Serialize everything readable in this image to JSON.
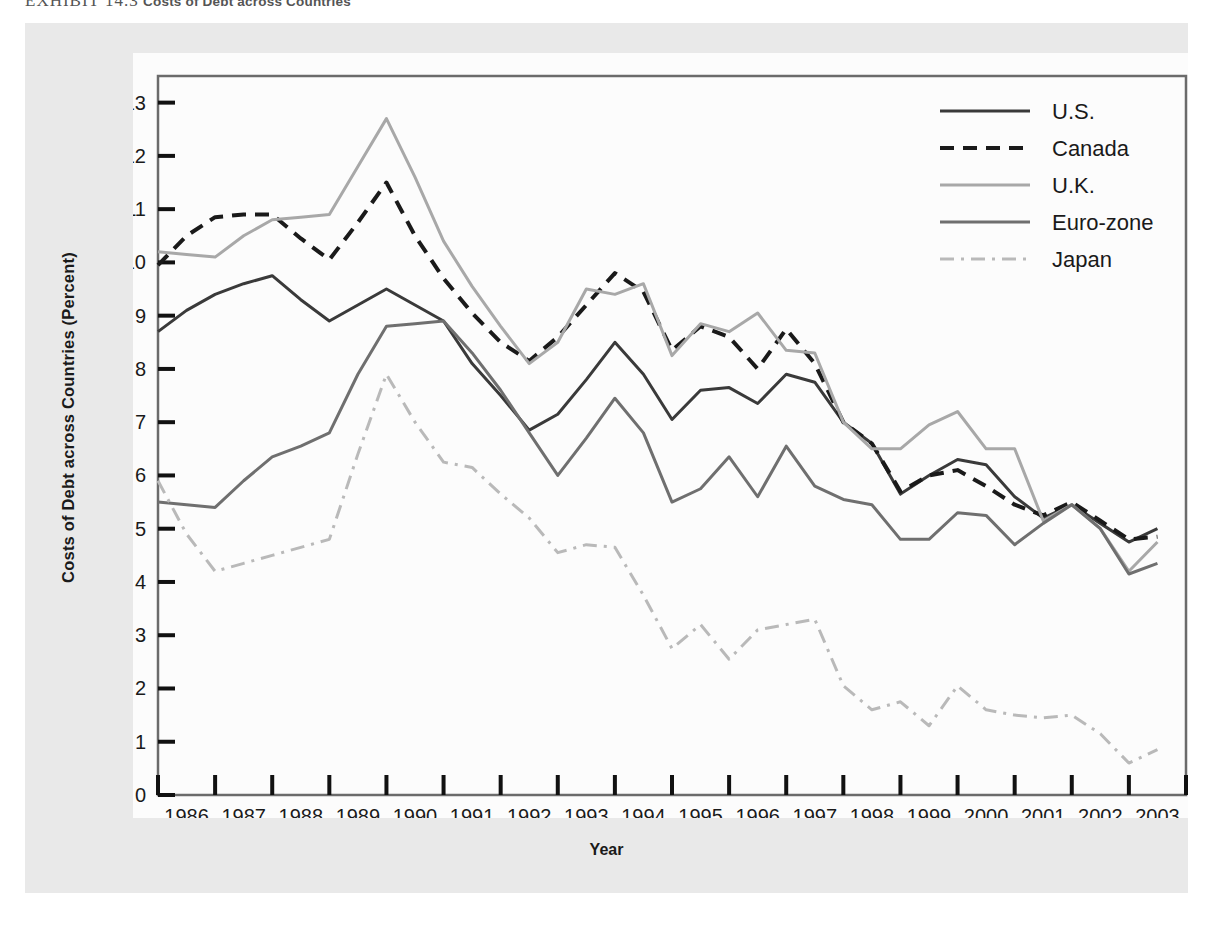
{
  "exhibit": {
    "number": "EXHIBIT 14.3",
    "caption": "Costs of Debt across Countries"
  },
  "axis_titles": {
    "x": "Year",
    "y": "Costs of Debt across Countries (Percent)"
  },
  "colors": {
    "us": "#3a3a3a",
    "canada": "#1a1a1a",
    "uk": "#a8a8a8",
    "eurozone": "#6f6f6f",
    "japan": "#b9b9b9",
    "panel": "#e9e9e9",
    "canvas": "#fcfcfc",
    "axis": "#6b6b6b",
    "text": "#1a1a1a"
  },
  "chart_data": {
    "type": "line",
    "title": "Costs of Debt across Countries",
    "xlabel": "Year",
    "ylabel": "Costs of Debt across Countries (Percent)",
    "xlim": [
      1986,
      2004
    ],
    "ylim": [
      0,
      13.5
    ],
    "ytick_values": [
      0,
      1,
      2,
      3,
      4,
      5,
      6,
      7,
      8,
      9,
      10,
      11,
      12,
      13
    ],
    "ytick_labels": [
      "0",
      "1",
      "2",
      "3",
      "4",
      "5",
      "6",
      "7",
      "8",
      "9",
      "10",
      "11",
      "12",
      "13"
    ],
    "xtick_values": [
      1986,
      1987,
      1988,
      1989,
      1990,
      1991,
      1992,
      1993,
      1994,
      1995,
      1996,
      1997,
      1998,
      1999,
      2000,
      2001,
      2002,
      2003,
      2004
    ],
    "xtick_labels": [
      "1986",
      "1987",
      "1988",
      "1989",
      "1990",
      "1991",
      "1992",
      "1993",
      "1994",
      "1995",
      "1996",
      "1997",
      "1998",
      "1999",
      "2000",
      "2001",
      "2002",
      "2003"
    ],
    "grid": false,
    "legend_position": "top-right",
    "x": [
      1986.0,
      1986.5,
      1987.0,
      1987.5,
      1988.0,
      1988.5,
      1989.0,
      1989.5,
      1990.0,
      1990.5,
      1991.0,
      1991.5,
      1992.0,
      1992.5,
      1993.0,
      1993.5,
      1994.0,
      1994.5,
      1995.0,
      1995.5,
      1996.0,
      1996.5,
      1997.0,
      1997.5,
      1998.0,
      1998.5,
      1999.0,
      1999.5,
      2000.0,
      2000.5,
      2001.0,
      2001.5,
      2002.0,
      2002.5,
      2003.0,
      2003.5
    ],
    "series": [
      {
        "name": "U.S.",
        "style": "solid",
        "color": "#3a3a3a",
        "values": [
          8.7,
          9.1,
          9.4,
          9.6,
          9.75,
          9.3,
          8.9,
          9.2,
          9.5,
          9.2,
          8.9,
          8.1,
          7.5,
          6.85,
          7.15,
          7.8,
          8.5,
          7.9,
          7.05,
          7.6,
          7.65,
          7.35,
          7.9,
          7.75,
          7.0,
          6.6,
          5.65,
          6.0,
          6.3,
          6.2,
          5.6,
          5.2,
          5.45,
          5.1,
          4.75,
          5.0
        ]
      },
      {
        "name": "Canada",
        "style": "dashed",
        "color": "#1a1a1a",
        "values": [
          9.95,
          10.5,
          10.85,
          10.9,
          10.9,
          10.45,
          10.05,
          10.75,
          11.5,
          10.5,
          9.7,
          9.05,
          8.5,
          8.15,
          8.6,
          9.2,
          9.8,
          9.45,
          8.35,
          8.8,
          8.6,
          8.0,
          8.75,
          8.1,
          7.0,
          6.6,
          5.7,
          6.0,
          6.1,
          5.8,
          5.45,
          5.25,
          5.5,
          5.15,
          4.8,
          4.85
        ]
      },
      {
        "name": "U.K.",
        "style": "solid",
        "color": "#a8a8a8",
        "values": [
          10.2,
          10.15,
          10.1,
          10.5,
          10.8,
          10.85,
          10.9,
          11.8,
          12.7,
          11.6,
          10.4,
          9.55,
          8.8,
          8.1,
          8.5,
          9.5,
          9.4,
          9.6,
          8.25,
          8.85,
          8.7,
          9.05,
          8.35,
          8.3,
          7.0,
          6.5,
          6.5,
          6.95,
          7.2,
          6.5,
          6.5,
          5.15,
          5.45,
          5.0,
          4.2,
          4.75
        ]
      },
      {
        "name": "Euro-zone",
        "style": "solid",
        "color": "#6f6f6f",
        "values": [
          5.5,
          5.45,
          5.4,
          5.9,
          6.35,
          6.55,
          6.8,
          7.9,
          8.8,
          8.85,
          8.9,
          8.3,
          7.6,
          6.8,
          6.0,
          6.7,
          7.45,
          6.8,
          5.5,
          5.75,
          6.35,
          5.6,
          6.55,
          5.8,
          5.55,
          5.45,
          4.8,
          4.8,
          5.3,
          5.25,
          4.7,
          5.1,
          5.45,
          5.0,
          4.15,
          4.35
        ]
      },
      {
        "name": "Japan",
        "style": "dashdot",
        "color": "#b9b9b9",
        "values": [
          5.9,
          4.9,
          4.2,
          4.35,
          4.5,
          4.65,
          4.8,
          6.4,
          7.9,
          7.0,
          6.25,
          6.15,
          5.65,
          5.2,
          4.55,
          4.7,
          4.65,
          3.75,
          2.75,
          3.2,
          2.55,
          3.1,
          3.2,
          3.3,
          2.05,
          1.6,
          1.75,
          1.3,
          2.05,
          1.6,
          1.5,
          1.45,
          1.5,
          1.15,
          0.6,
          0.85
        ]
      }
    ]
  },
  "legend": {
    "items": [
      {
        "label": "U.S.",
        "style": "solid",
        "color": "#3a3a3a"
      },
      {
        "label": "Canada",
        "style": "dashed",
        "color": "#1a1a1a"
      },
      {
        "label": "U.K.",
        "style": "solid",
        "color": "#a8a8a8"
      },
      {
        "label": "Euro-zone",
        "style": "solid",
        "color": "#6f6f6f"
      },
      {
        "label": "Japan",
        "style": "dashdot",
        "color": "#b9b9b9"
      }
    ]
  }
}
